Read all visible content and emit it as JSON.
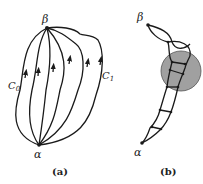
{
  "figure": {
    "panel_a": {
      "caption": "(a)",
      "start_label": "α",
      "end_label": "β",
      "left_curve_label": "C",
      "left_curve_sub": "0",
      "right_curve_label": "C",
      "right_curve_sub": "1",
      "curve_count": 6
    },
    "panel_b": {
      "caption": "(b)",
      "start_label": "α",
      "end_label": "β",
      "disk_color": "#a0a0a0"
    },
    "colors": {
      "stroke": "#1a1a1a",
      "background": "#ffffff"
    }
  }
}
